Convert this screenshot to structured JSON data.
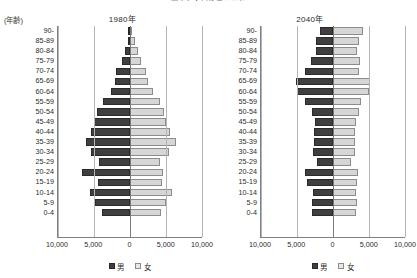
{
  "top_title": "図2-1  人口ピラミッド",
  "axis_unit_label": "(年齢)",
  "legend": {
    "male_label": "男",
    "female_label": "女",
    "male_color": "#3f3f3f",
    "female_color": "#d6d6d6"
  },
  "xticks": [
    "10,000",
    "5,000",
    "0",
    "5,000",
    "10,000"
  ],
  "age_groups": [
    "90-",
    "85-89",
    "80-84",
    "75-79",
    "70-74",
    "65-69",
    "60-64",
    "55-59",
    "50-54",
    "45-49",
    "40-44",
    "35-39",
    "30-34",
    "25-29",
    "20-24",
    "15-19",
    "10-14",
    "5-9",
    "0-4"
  ],
  "panels": [
    {
      "id": "p1980",
      "title": "1980年"
    },
    {
      "id": "p2040",
      "title": "2040年"
    }
  ],
  "chart_data": [
    {
      "type": "bar",
      "title": "1980年",
      "subtitle": "",
      "xlabel": "",
      "ylabel": "(年齢)",
      "xlim": [
        -10000,
        10000
      ],
      "xticks": [
        -10000,
        -5000,
        0,
        5000,
        10000
      ],
      "xticklabels": [
        "10,000",
        "5,000",
        "0",
        "5,000",
        "10,000"
      ],
      "grid": true,
      "legend_position": "bottom",
      "orientation": "horizontal-diverging",
      "categories": [
        "90-",
        "85-89",
        "80-84",
        "75-79",
        "70-74",
        "65-69",
        "60-64",
        "55-59",
        "50-54",
        "45-49",
        "40-44",
        "35-39",
        "30-34",
        "25-29",
        "20-24",
        "15-19",
        "10-14",
        "5-9",
        "0-4"
      ],
      "series": [
        {
          "name": "男",
          "direction": "left",
          "values": [
            120,
            330,
            720,
            1180,
            1900,
            2150,
            2700,
            3750,
            4550,
            5000,
            5350,
            6150,
            5400,
            4350,
            6700,
            4500,
            5500,
            4900,
            3900
          ]
        },
        {
          "name": "女",
          "direction": "right",
          "values": [
            330,
            700,
            1150,
            1550,
            2250,
            2550,
            3200,
            4100,
            4750,
            5050,
            5550,
            6400,
            5350,
            4200,
            4600,
            4400,
            5800,
            5000,
            4300
          ]
        }
      ]
    },
    {
      "type": "bar",
      "title": "2040年",
      "subtitle": "",
      "xlabel": "",
      "ylabel": "(年齢)",
      "xlim": [
        -10000,
        10000
      ],
      "xticks": [
        -10000,
        -5000,
        0,
        5000,
        10000
      ],
      "xticklabels": [
        "10,000",
        "5,000",
        "0",
        "5,000",
        "10,000"
      ],
      "grid": true,
      "legend_position": "bottom",
      "orientation": "horizontal-diverging",
      "categories": [
        "90-",
        "85-89",
        "80-84",
        "75-79",
        "70-74",
        "65-69",
        "60-64",
        "55-59",
        "50-54",
        "45-49",
        "40-44",
        "35-39",
        "30-34",
        "25-29",
        "20-24",
        "15-19",
        "10-14",
        "5-9",
        "0-4"
      ],
      "series": [
        {
          "name": "男",
          "direction": "left",
          "values": [
            1750,
            2300,
            2400,
            3100,
            3850,
            5200,
            4950,
            3900,
            2900,
            2450,
            2700,
            2700,
            2800,
            2200,
            3950,
            3600,
            2800,
            2850,
            2950
          ]
        },
        {
          "name": "女",
          "direction": "right",
          "values": [
            4100,
            3600,
            3400,
            3700,
            3650,
            5100,
            4950,
            3900,
            3550,
            3250,
            3100,
            3050,
            3000,
            2500,
            3450,
            3350,
            3200,
            3300,
            3200
          ]
        }
      ]
    }
  ]
}
